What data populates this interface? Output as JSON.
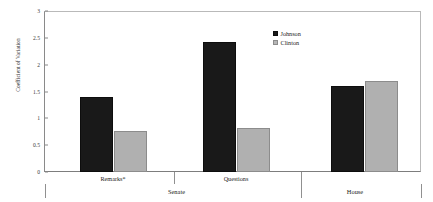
{
  "chart_data": {
    "type": "bar",
    "title": "",
    "xlabel": "",
    "ylabel": "Coefficient of Variation",
    "ylim": [
      0,
      3
    ],
    "yticks": [
      "0",
      "0.5",
      "1",
      "1.5",
      "2",
      "2.5",
      "3"
    ],
    "ytick_values": [
      0,
      0.5,
      1,
      1.5,
      2,
      2.5,
      3
    ],
    "grid": false,
    "legend_position": "top-right",
    "categories": [
      "Remarks*",
      "Questions",
      ""
    ],
    "groups": [
      "Senate",
      "Senate",
      "House"
    ],
    "top_level_categories": [
      "Senate",
      "House"
    ],
    "series": [
      {
        "name": "Johnson",
        "color": "#191919",
        "values": [
          1.39,
          2.42,
          1.6
        ]
      },
      {
        "name": "Clinton",
        "color": "#b0b0b0",
        "values": [
          0.76,
          0.82,
          1.7
        ]
      }
    ]
  },
  "legend": {
    "items": [
      {
        "label": "Johnson",
        "swatch": "black-square-swatch"
      },
      {
        "label": "Clinton",
        "swatch": "gray-square-swatch"
      }
    ]
  },
  "axis": {
    "y_label": "Coefficient of Variation",
    "y_ticks": [
      "0",
      "0.5",
      "1",
      "1.5",
      "2",
      "2.5",
      "3"
    ]
  },
  "x_axis": {
    "group_labels": [
      "Remarks*",
      "Questions",
      ""
    ],
    "category_labels": [
      "Senate",
      "House"
    ]
  }
}
